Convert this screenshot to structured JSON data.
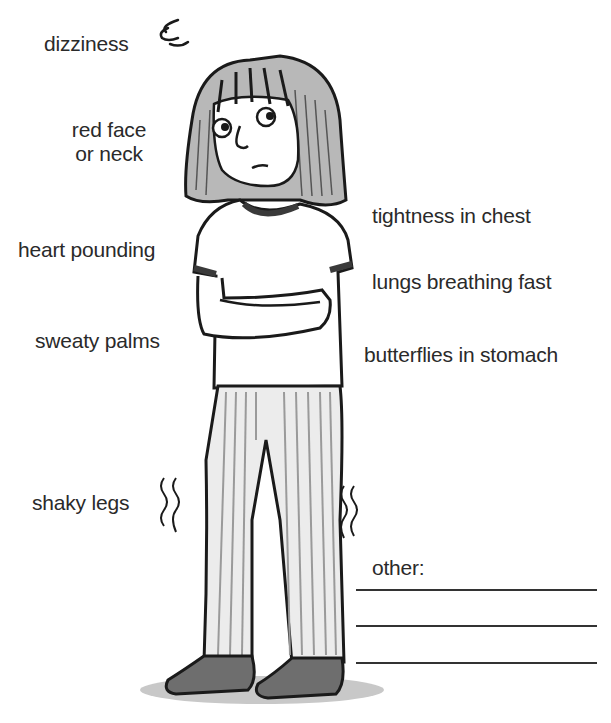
{
  "labels": {
    "dizziness": "dizziness",
    "red_face_line1": "red face",
    "red_face_line2": "or neck",
    "heart_pounding": "heart pounding",
    "sweaty_palms": "sweaty palms",
    "shaky_legs": "shaky legs",
    "tightness_in_chest": "tightness in chest",
    "lungs_breathing_fast": "lungs breathing fast",
    "butterflies_in_stomach": "butterflies in stomach",
    "other": "other:"
  },
  "other_lines": [
    {
      "value": ""
    },
    {
      "value": ""
    },
    {
      "value": ""
    }
  ],
  "figure": {
    "colors": {
      "outline": "#1a1a1a",
      "hair_shade": "#8a8a8a",
      "shirt": "#ffffff",
      "trim": "#3a3a3a",
      "pants_stripe": "#9a9a9a",
      "shoes": "#6e6e6e",
      "shadow": "#bdbdbd"
    }
  }
}
